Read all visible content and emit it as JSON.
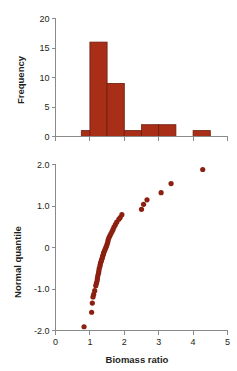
{
  "figure": {
    "title": "",
    "background_color": "#ffffff",
    "accent_color": "#a82e17",
    "point_color": "#8b2010",
    "axis_color": "#8a8a8a",
    "text_color": "#231f20"
  },
  "chart_data": [
    {
      "type": "bar",
      "subtype": "histogram",
      "title": "",
      "xlabel": "",
      "ylabel": "Frequency",
      "xlim": [
        0,
        5
      ],
      "ylim": [
        0,
        20
      ],
      "grid": false,
      "legend": null,
      "xticks": [
        0,
        1,
        2,
        3,
        4,
        5
      ],
      "xtick_labels": [
        "",
        "",
        "",
        "",
        "",
        ""
      ],
      "yticks": [
        0,
        5,
        10,
        15,
        20
      ],
      "ytick_labels": [
        "0",
        "5",
        "10",
        "15",
        "20"
      ],
      "bin_width": 0.5,
      "bins": [
        {
          "x0": 0.75,
          "x1": 1.0,
          "value": 1
        },
        {
          "x0": 1.0,
          "x1": 1.5,
          "value": 16
        },
        {
          "x0": 1.5,
          "x1": 2.0,
          "value": 9
        },
        {
          "x0": 2.0,
          "x1": 2.5,
          "value": 1
        },
        {
          "x0": 2.5,
          "x1": 3.0,
          "value": 2
        },
        {
          "x0": 3.0,
          "x1": 3.5,
          "value": 2
        },
        {
          "x0": 4.0,
          "x1": 4.5,
          "value": 1
        }
      ],
      "bar_fill": "#a82e17",
      "bar_edge": "#6d1c0c"
    },
    {
      "type": "scatter",
      "subtype": "normal-quantile-plot",
      "title": "",
      "xlabel": "Biomass ratio",
      "ylabel": "Normal quantile",
      "xlim": [
        0,
        5
      ],
      "ylim": [
        -2.0,
        2.0
      ],
      "grid": false,
      "legend": null,
      "xticks": [
        0,
        1,
        2,
        3,
        4,
        5
      ],
      "xtick_labels": [
        "0",
        "1",
        "2",
        "3",
        "4",
        "5"
      ],
      "yticks": [
        -2.0,
        -1.0,
        0,
        1.0,
        2.0
      ],
      "ytick_labels": [
        "-2.0",
        "-1.0",
        "0",
        "1.0",
        "2.0"
      ],
      "marker": "circle",
      "marker_color": "#8b2010",
      "marker_size": 2.6,
      "points": [
        {
          "x": 0.83,
          "y": -1.91
        },
        {
          "x": 1.05,
          "y": -1.56
        },
        {
          "x": 1.07,
          "y": -1.34
        },
        {
          "x": 1.09,
          "y": -1.19
        },
        {
          "x": 1.11,
          "y": -1.13
        },
        {
          "x": 1.14,
          "y": -1.04
        },
        {
          "x": 1.17,
          "y": -0.92
        },
        {
          "x": 1.19,
          "y": -0.86
        },
        {
          "x": 1.21,
          "y": -0.8
        },
        {
          "x": 1.22,
          "y": -0.74
        },
        {
          "x": 1.23,
          "y": -0.68
        },
        {
          "x": 1.25,
          "y": -0.62
        },
        {
          "x": 1.26,
          "y": -0.57
        },
        {
          "x": 1.27,
          "y": -0.51
        },
        {
          "x": 1.29,
          "y": -0.46
        },
        {
          "x": 1.3,
          "y": -0.41
        },
        {
          "x": 1.31,
          "y": -0.37
        },
        {
          "x": 1.33,
          "y": -0.33
        },
        {
          "x": 1.34,
          "y": -0.29
        },
        {
          "x": 1.36,
          "y": -0.25
        },
        {
          "x": 1.37,
          "y": -0.21
        },
        {
          "x": 1.39,
          "y": -0.17
        },
        {
          "x": 1.4,
          "y": -0.13
        },
        {
          "x": 1.42,
          "y": -0.09
        },
        {
          "x": 1.44,
          "y": -0.05
        },
        {
          "x": 1.46,
          "y": -0.01
        },
        {
          "x": 1.48,
          "y": 0.03
        },
        {
          "x": 1.5,
          "y": 0.08
        },
        {
          "x": 1.52,
          "y": 0.13
        },
        {
          "x": 1.53,
          "y": 0.18
        },
        {
          "x": 1.55,
          "y": 0.23
        },
        {
          "x": 1.58,
          "y": 0.28
        },
        {
          "x": 1.61,
          "y": 0.33
        },
        {
          "x": 1.64,
          "y": 0.38
        },
        {
          "x": 1.67,
          "y": 0.43
        },
        {
          "x": 1.7,
          "y": 0.49
        },
        {
          "x": 1.74,
          "y": 0.55
        },
        {
          "x": 1.78,
          "y": 0.61
        },
        {
          "x": 1.84,
          "y": 0.68
        },
        {
          "x": 1.88,
          "y": 0.72
        },
        {
          "x": 1.93,
          "y": 0.79
        },
        {
          "x": 2.5,
          "y": 0.92
        },
        {
          "x": 2.56,
          "y": 1.04
        },
        {
          "x": 2.66,
          "y": 1.15
        },
        {
          "x": 3.07,
          "y": 1.32
        },
        {
          "x": 3.36,
          "y": 1.54
        },
        {
          "x": 4.28,
          "y": 1.88
        }
      ]
    }
  ]
}
